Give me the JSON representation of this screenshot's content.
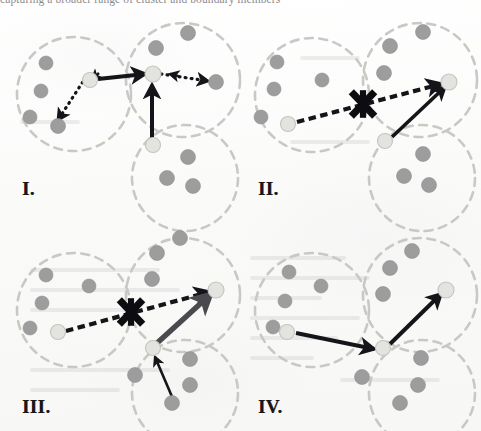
{
  "figure": {
    "name": "four-panel-cluster-migration-diagram",
    "width": 481,
    "height": 431,
    "background_color": "#fbfbfa",
    "header_partial_text": "capturing a broader range of cluster and boundary members",
    "colors": {
      "cluster_boundary": "#c8c8c4",
      "normal_point": "#9d9d9d",
      "highlight_point": "#e3e3df",
      "arrow_solid": "#141419",
      "arrow_thick_gray": "#4a4a4e",
      "arrow_dashed": "#141419",
      "reject_mark": "#0d0d11",
      "label_text": "#16161a"
    }
  },
  "panels": [
    {
      "id": "panel-1",
      "label": "I.",
      "label_x": 22,
      "label_y": 178,
      "clusters": [
        {
          "name": "cluster-left",
          "cx": 74,
          "cy": 94,
          "r": 57
        },
        {
          "name": "cluster-top",
          "cx": 183,
          "cy": 80,
          "r": 57
        },
        {
          "name": "cluster-bottom",
          "cx": 185,
          "cy": 178,
          "r": 53
        }
      ],
      "points": [
        {
          "name": "point-normal",
          "cx": 46,
          "cy": 63,
          "r": 7.0,
          "kind": "normal"
        },
        {
          "name": "point-normal",
          "cx": 41,
          "cy": 91,
          "r": 7.0,
          "kind": "normal"
        },
        {
          "name": "point-normal",
          "cx": 30,
          "cy": 117,
          "r": 7.0,
          "kind": "normal"
        },
        {
          "name": "point-normal",
          "cx": 58,
          "cy": 126,
          "r": 7.5,
          "kind": "normal"
        },
        {
          "name": "point-highlight",
          "cx": 90,
          "cy": 80,
          "r": 7.5,
          "kind": "highlight"
        },
        {
          "name": "point-normal",
          "cx": 156,
          "cy": 48,
          "r": 7.5,
          "kind": "normal"
        },
        {
          "name": "point-normal",
          "cx": 188,
          "cy": 33,
          "r": 7.5,
          "kind": "normal"
        },
        {
          "name": "point-highlight",
          "cx": 153,
          "cy": 74,
          "r": 8.0,
          "kind": "highlight"
        },
        {
          "name": "point-normal",
          "cx": 216,
          "cy": 82,
          "r": 7.5,
          "kind": "normal"
        },
        {
          "name": "point-highlight",
          "cx": 153,
          "cy": 145,
          "r": 7.5,
          "kind": "highlight"
        },
        {
          "name": "point-normal",
          "cx": 188,
          "cy": 157,
          "r": 7.5,
          "kind": "normal"
        },
        {
          "name": "point-normal",
          "cx": 167,
          "cy": 178,
          "r": 7.5,
          "kind": "normal"
        },
        {
          "name": "point-normal",
          "cx": 193,
          "cy": 186,
          "r": 7.5,
          "kind": "normal"
        }
      ],
      "arrows": [
        {
          "name": "arrow-solid-horizontal",
          "x1": 98,
          "y1": 79,
          "x2": 145,
          "y2": 74,
          "style": "solid",
          "width": 4.0
        },
        {
          "name": "arrow-solid-vertical",
          "x1": 152,
          "y1": 139,
          "x2": 152,
          "y2": 85,
          "style": "solid",
          "width": 4.0
        },
        {
          "name": "arrow-dotted-to-left",
          "x1": 86,
          "y1": 77,
          "x2": 58,
          "y2": 120,
          "style": "dotted",
          "width": 3.2
        },
        {
          "name": "arrow-dotted-to-right",
          "x1": 161,
          "y1": 74,
          "x2": 208,
          "y2": 81,
          "style": "dotted",
          "width": 3.2
        }
      ],
      "reject_marks": []
    },
    {
      "id": "panel-2",
      "label": "II.",
      "label_x": 258,
      "label_y": 178,
      "clusters": [
        {
          "name": "cluster-left",
          "cx": 312,
          "cy": 95,
          "r": 57
        },
        {
          "name": "cluster-top",
          "cx": 420,
          "cy": 80,
          "r": 57
        },
        {
          "name": "cluster-bottom",
          "cx": 422,
          "cy": 178,
          "r": 53
        }
      ],
      "points": [
        {
          "name": "point-normal",
          "cx": 277,
          "cy": 62,
          "r": 7.0,
          "kind": "normal"
        },
        {
          "name": "point-normal",
          "cx": 274,
          "cy": 89,
          "r": 7.0,
          "kind": "normal"
        },
        {
          "name": "point-normal",
          "cx": 261,
          "cy": 117,
          "r": 7.0,
          "kind": "normal"
        },
        {
          "name": "point-normal",
          "cx": 322,
          "cy": 80,
          "r": 7.0,
          "kind": "normal"
        },
        {
          "name": "point-highlight",
          "cx": 288,
          "cy": 124,
          "r": 7.5,
          "kind": "highlight"
        },
        {
          "name": "point-normal",
          "cx": 390,
          "cy": 46,
          "r": 7.5,
          "kind": "normal"
        },
        {
          "name": "point-normal",
          "cx": 423,
          "cy": 32,
          "r": 7.5,
          "kind": "normal"
        },
        {
          "name": "point-normal",
          "cx": 384,
          "cy": 73,
          "r": 7.5,
          "kind": "normal"
        },
        {
          "name": "point-highlight",
          "cx": 449,
          "cy": 82,
          "r": 8.0,
          "kind": "highlight"
        },
        {
          "name": "point-highlight",
          "cx": 385,
          "cy": 141,
          "r": 7.5,
          "kind": "highlight"
        },
        {
          "name": "point-normal",
          "cx": 423,
          "cy": 154,
          "r": 7.5,
          "kind": "normal"
        },
        {
          "name": "point-normal",
          "cx": 404,
          "cy": 176,
          "r": 7.5,
          "kind": "normal"
        },
        {
          "name": "point-normal",
          "cx": 429,
          "cy": 185,
          "r": 7.5,
          "kind": "normal"
        }
      ],
      "arrows": [
        {
          "name": "arrow-dashed-rejected",
          "x1": 297,
          "y1": 122,
          "x2": 441,
          "y2": 84,
          "style": "dashed",
          "width": 4.2
        },
        {
          "name": "arrow-solid-diagonal",
          "x1": 392,
          "y1": 137,
          "x2": 445,
          "y2": 87,
          "style": "solid",
          "width": 3.6
        }
      ],
      "reject_marks": [
        {
          "name": "reject-x-mark",
          "cx": 363,
          "cy": 104,
          "size": 15
        }
      ]
    },
    {
      "id": "panel-3",
      "label": "III.",
      "label_x": 22,
      "label_y": 396,
      "clusters": [
        {
          "name": "cluster-left",
          "cx": 74,
          "cy": 310,
          "r": 57
        },
        {
          "name": "cluster-top",
          "cx": 183,
          "cy": 295,
          "r": 57
        },
        {
          "name": "cluster-bottom",
          "cx": 185,
          "cy": 393,
          "r": 53
        }
      ],
      "points": [
        {
          "name": "point-normal",
          "cx": 46,
          "cy": 275,
          "r": 7.0,
          "kind": "normal"
        },
        {
          "name": "point-normal",
          "cx": 42,
          "cy": 303,
          "r": 7.0,
          "kind": "normal"
        },
        {
          "name": "point-normal",
          "cx": 30,
          "cy": 328,
          "r": 7.0,
          "kind": "normal"
        },
        {
          "name": "point-normal",
          "cx": 89,
          "cy": 286,
          "r": 7.0,
          "kind": "normal"
        },
        {
          "name": "point-highlight",
          "cx": 58,
          "cy": 332,
          "r": 7.5,
          "kind": "highlight"
        },
        {
          "name": "point-normal",
          "cx": 157,
          "cy": 253,
          "r": 7.5,
          "kind": "normal"
        },
        {
          "name": "point-normal",
          "cx": 180,
          "cy": 238,
          "r": 7.5,
          "kind": "normal"
        },
        {
          "name": "point-normal",
          "cx": 152,
          "cy": 279,
          "r": 7.5,
          "kind": "normal"
        },
        {
          "name": "point-highlight",
          "cx": 216,
          "cy": 290,
          "r": 8.0,
          "kind": "highlight"
        },
        {
          "name": "point-highlight",
          "cx": 153,
          "cy": 348,
          "r": 7.5,
          "kind": "highlight"
        },
        {
          "name": "point-normal",
          "cx": 190,
          "cy": 359,
          "r": 7.5,
          "kind": "normal"
        },
        {
          "name": "point-normal",
          "cx": 135,
          "cy": 375,
          "r": 7.5,
          "kind": "normal"
        },
        {
          "name": "point-normal",
          "cx": 190,
          "cy": 385,
          "r": 7.5,
          "kind": "normal"
        },
        {
          "name": "point-normal",
          "cx": 172,
          "cy": 403,
          "r": 7.5,
          "kind": "normal"
        }
      ],
      "arrows": [
        {
          "name": "arrow-dashed-rejected",
          "x1": 66,
          "y1": 331,
          "x2": 209,
          "y2": 292,
          "style": "dashed",
          "width": 4.2
        },
        {
          "name": "arrow-thick-gray-diagonal",
          "x1": 156,
          "y1": 344,
          "x2": 211,
          "y2": 294,
          "style": "thick-gray",
          "width": 5.4
        },
        {
          "name": "arrow-solid-thin-upward",
          "x1": 173,
          "y1": 399,
          "x2": 155,
          "y2": 357,
          "style": "solid",
          "width": 2.6
        }
      ],
      "reject_marks": [
        {
          "name": "reject-x-mark",
          "cx": 131,
          "cy": 312,
          "size": 15
        }
      ]
    },
    {
      "id": "panel-4",
      "label": "IV.",
      "label_x": 258,
      "label_y": 396,
      "clusters": [
        {
          "name": "cluster-left",
          "cx": 312,
          "cy": 310,
          "r": 57
        },
        {
          "name": "cluster-top",
          "cx": 420,
          "cy": 295,
          "r": 57
        },
        {
          "name": "cluster-bottom",
          "cx": 422,
          "cy": 393,
          "r": 53
        }
      ],
      "points": [
        {
          "name": "point-normal",
          "cx": 289,
          "cy": 272,
          "r": 7.0,
          "kind": "normal"
        },
        {
          "name": "point-normal",
          "cx": 285,
          "cy": 301,
          "r": 7.0,
          "kind": "normal"
        },
        {
          "name": "point-normal",
          "cx": 273,
          "cy": 327,
          "r": 7.0,
          "kind": "normal"
        },
        {
          "name": "point-normal",
          "cx": 321,
          "cy": 286,
          "r": 7.0,
          "kind": "normal"
        },
        {
          "name": "point-highlight",
          "cx": 287,
          "cy": 332,
          "r": 7.5,
          "kind": "highlight"
        },
        {
          "name": "point-normal",
          "cx": 390,
          "cy": 268,
          "r": 7.5,
          "kind": "normal"
        },
        {
          "name": "point-normal",
          "cx": 412,
          "cy": 251,
          "r": 7.5,
          "kind": "normal"
        },
        {
          "name": "point-normal",
          "cx": 383,
          "cy": 294,
          "r": 7.5,
          "kind": "normal"
        },
        {
          "name": "point-highlight",
          "cx": 446,
          "cy": 290,
          "r": 8.0,
          "kind": "highlight"
        },
        {
          "name": "point-highlight",
          "cx": 383,
          "cy": 348,
          "r": 7.5,
          "kind": "highlight"
        },
        {
          "name": "point-normal",
          "cx": 421,
          "cy": 358,
          "r": 7.5,
          "kind": "normal"
        },
        {
          "name": "point-normal",
          "cx": 362,
          "cy": 377,
          "r": 7.5,
          "kind": "normal"
        },
        {
          "name": "point-normal",
          "cx": 418,
          "cy": 385,
          "r": 7.5,
          "kind": "normal"
        },
        {
          "name": "point-normal",
          "cx": 400,
          "cy": 403,
          "r": 7.5,
          "kind": "normal"
        }
      ],
      "arrows": [
        {
          "name": "arrow-solid-to-center",
          "x1": 296,
          "y1": 333,
          "x2": 374,
          "y2": 349,
          "style": "solid",
          "width": 4.0
        },
        {
          "name": "arrow-solid-to-upper",
          "x1": 390,
          "y1": 344,
          "x2": 441,
          "y2": 294,
          "style": "solid",
          "width": 4.0
        }
      ],
      "reject_marks": []
    }
  ],
  "ghost_lines": [
    {
      "x": 250,
      "y": 256,
      "w": 96
    },
    {
      "x": 250,
      "y": 276,
      "w": 120
    },
    {
      "x": 250,
      "y": 296,
      "w": 72
    },
    {
      "x": 250,
      "y": 316,
      "w": 110
    },
    {
      "x": 250,
      "y": 336,
      "w": 88
    },
    {
      "x": 250,
      "y": 356,
      "w": 64
    },
    {
      "x": 340,
      "y": 378,
      "w": 100
    },
    {
      "x": 30,
      "y": 268,
      "w": 130
    },
    {
      "x": 30,
      "y": 288,
      "w": 150
    },
    {
      "x": 30,
      "y": 308,
      "w": 110
    },
    {
      "x": 30,
      "y": 368,
      "w": 140
    },
    {
      "x": 30,
      "y": 388,
      "w": 90
    },
    {
      "x": 20,
      "y": 120,
      "w": 60
    },
    {
      "x": 300,
      "y": 56,
      "w": 60
    },
    {
      "x": 290,
      "y": 140,
      "w": 80
    }
  ]
}
